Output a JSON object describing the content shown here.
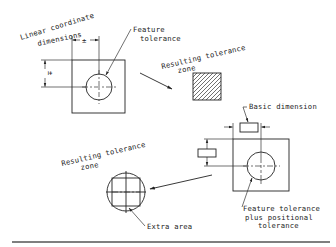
{
  "figure": {
    "type": "engineering-drawing",
    "colors": {
      "line": "#222222",
      "background": "#ffffff",
      "rule": "#555555"
    }
  },
  "top_left_view": {
    "label_line1": "Linear coordinate",
    "label_line2": "dimensions",
    "horizontal_dim_text": "±",
    "vertical_dim_text": "±",
    "feature_callout_line1": "Feature",
    "feature_callout_line2": "tolerance"
  },
  "top_right_view": {
    "zone_label_line1": "Resulting tolerance",
    "zone_label_line2": "zone",
    "zone_shape": "square (hatched)"
  },
  "bottom_right_view": {
    "basic_dimension_label": "Basic dimension",
    "feature_callout_line1": "Feature tolerance",
    "feature_callout_line2": "plus positional",
    "feature_callout_line3": "tolerance"
  },
  "bottom_left_view": {
    "zone_label_line1": "Resulting tolerance",
    "zone_label_line2": "zone",
    "extra_area_label": "Extra area",
    "zone_shape": "circle circumscribing square"
  }
}
